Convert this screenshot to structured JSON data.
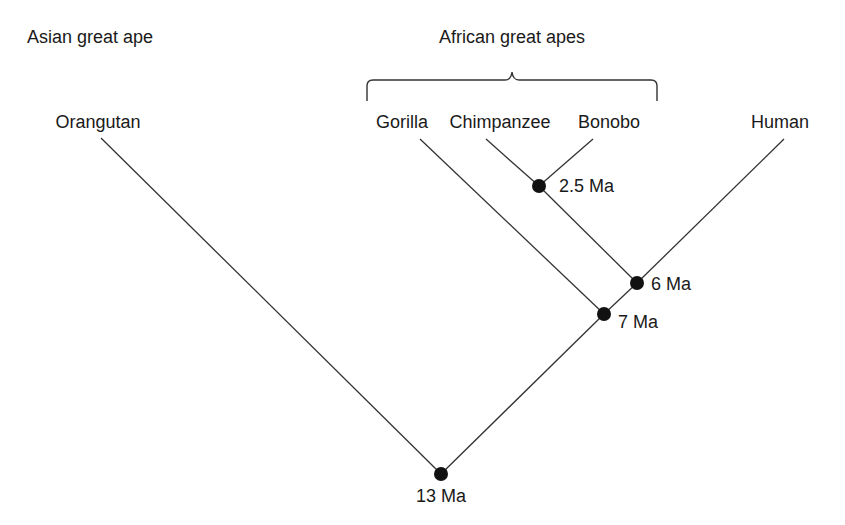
{
  "groups": {
    "asian": "Asian great ape",
    "african": "African great apes"
  },
  "taxa": {
    "orangutan": "Orangutan",
    "gorilla": "Gorilla",
    "chimpanzee": "Chimpanzee",
    "bonobo": "Bonobo",
    "human": "Human"
  },
  "nodes": {
    "root": "13 Ma",
    "gorilla_split": "7 Ma",
    "human_split": "6 Ma",
    "chimp_bonobo_split": "2.5 Ma"
  },
  "colors": {
    "line": "#333333",
    "node": "#111111",
    "text": "#1a1a1a"
  }
}
